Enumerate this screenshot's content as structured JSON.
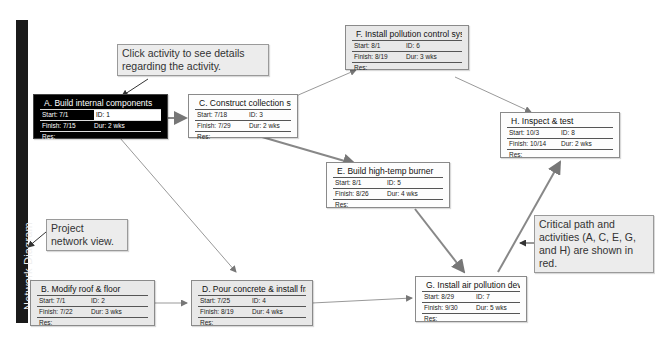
{
  "sidebar": {
    "label": "Network Diagram"
  },
  "callouts": {
    "click_activity": "Click activity to see details regarding the activity.",
    "project_network": "Project network view.",
    "critical_path": "Critical path and activities (A, C, E, G, and H) are shown in red."
  },
  "field_labels": {
    "start": "Start:",
    "finish": "Finish:",
    "id": "ID:",
    "dur": "Dur:",
    "res": "Res:"
  },
  "nodes": {
    "A": {
      "title": "A. Build internal components",
      "start": "7/1",
      "finish": "7/15",
      "id": "1",
      "dur": "2 wks",
      "res": "",
      "critical": true,
      "selected": true
    },
    "B": {
      "title": "B. Modify roof & floor",
      "start": "7/1",
      "finish": "7/22",
      "id": "2",
      "dur": "3 wks",
      "res": "",
      "critical": false
    },
    "C": {
      "title": "C. Construct collection stack",
      "start": "7/18",
      "finish": "7/29",
      "id": "3",
      "dur": "2 wks",
      "res": "",
      "critical": true
    },
    "D": {
      "title": "D. Pour concrete & install frame",
      "start": "7/25",
      "finish": "8/19",
      "id": "4",
      "dur": "4 wks",
      "res": "",
      "critical": false
    },
    "E": {
      "title": "E. Build high-temp burner",
      "start": "8/1",
      "finish": "8/26",
      "id": "5",
      "dur": "4 wks",
      "res": "",
      "critical": true
    },
    "F": {
      "title": "F. Install pollution control system",
      "start": "8/1",
      "finish": "8/19",
      "id": "6",
      "dur": "3 wks",
      "res": "",
      "critical": false
    },
    "G": {
      "title": "G. Install air pollution device",
      "start": "8/29",
      "finish": "9/30",
      "id": "7",
      "dur": "5 wks",
      "res": "",
      "critical": true
    },
    "H": {
      "title": "H. Inspect & test",
      "start": "10/3",
      "finish": "10/14",
      "id": "8",
      "dur": "2 wks",
      "res": "",
      "critical": true
    }
  },
  "edges": [
    {
      "from": "A",
      "to": "C",
      "critical": true
    },
    {
      "from": "A",
      "to": "D",
      "critical": false
    },
    {
      "from": "B",
      "to": "D",
      "critical": false
    },
    {
      "from": "C",
      "to": "F",
      "critical": false
    },
    {
      "from": "C",
      "to": "E",
      "critical": true
    },
    {
      "from": "F",
      "to": "H",
      "critical": false
    },
    {
      "from": "E",
      "to": "G",
      "critical": true
    },
    {
      "from": "D",
      "to": "G",
      "critical": false
    },
    {
      "from": "G",
      "to": "H",
      "critical": true
    }
  ],
  "colors": {
    "critical": "#8a8a8a",
    "normal": "#9a9a9a",
    "selected_bg": "#000000"
  }
}
